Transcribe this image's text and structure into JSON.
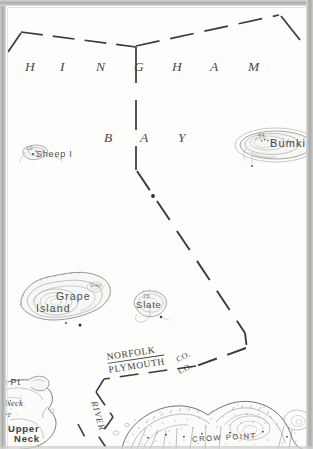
{
  "map": {
    "sheet_title": "Hingham Bay",
    "water_labels": [
      {
        "name": "hingham-label",
        "text": "HINGHAM",
        "letters": [
          "H",
          "I",
          "N",
          "G",
          "H",
          "A",
          "M"
        ]
      },
      {
        "name": "bay-label",
        "text": "BAY",
        "letters": [
          "B",
          "A",
          "Y"
        ]
      }
    ],
    "islands": [
      {
        "name": "sheep-island",
        "label": "Sheep I",
        "elevation_mark": "10"
      },
      {
        "name": "bumkin-island",
        "label": "Bumkin",
        "elevation_mark": "44"
      },
      {
        "name": "grape-island",
        "label": "Grape",
        "label2": "Island",
        "elevation_mark": "Gap"
      },
      {
        "name": "slate-island",
        "label": "Slate",
        "elevation_mark": "26"
      }
    ],
    "boundaries": [
      {
        "name": "town-boundary",
        "style": "dashed"
      },
      {
        "name": "county-boundary-north",
        "label": "NORFOLK",
        "suffix": "CO."
      },
      {
        "name": "county-boundary-south",
        "label": "PLYMOUTH",
        "suffix": "CO."
      }
    ],
    "shore_features": [
      {
        "name": "rock-point-label",
        "text": "k Pt"
      },
      {
        "name": "neck-label",
        "text": "Neck"
      },
      {
        "name": "cove-label",
        "text": "ve"
      },
      {
        "name": "upper-neck-label",
        "line1": "Upper",
        "line2": "Neck"
      },
      {
        "name": "weir-river-label",
        "text": "RIVER"
      },
      {
        "name": "crow-point-label",
        "text": "CROW POINT"
      }
    ],
    "colors": {
      "paper": "#fdfdfb",
      "ink": "#3b3b3b",
      "frame": "#b9b9b9",
      "contour": "#6f6f6f",
      "shore": "#555555"
    }
  }
}
